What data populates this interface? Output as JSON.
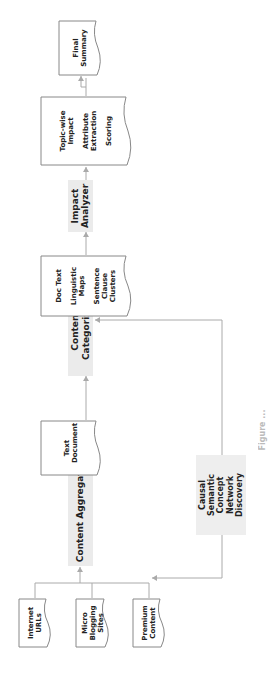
{
  "diagram": {
    "orientation": "rotated -90deg (reads bottom-to-top)",
    "inputs": [
      {
        "id": "internet-urls",
        "label": "Internet URLs"
      },
      {
        "id": "micro-blogging",
        "label": "Micro Blogging Sites"
      },
      {
        "id": "premium-content",
        "label": "Premium Content"
      }
    ],
    "processes": {
      "aggregator": "Content Aggregator",
      "categorizer": "Content Categorizer",
      "analyzer": "Impact Analyzer",
      "causal": "Causal Semantic Concept Network Discovery"
    },
    "documents": {
      "text_document": "Text Document",
      "doc_text": {
        "line1": "Doc Text",
        "line2": "Linguistic Maps",
        "line3": "Sentence Clause Clusters"
      },
      "topic_wise": {
        "line1": "Topic-wise Impact",
        "line2": "Attribute Extraction",
        "line3": "Scoring"
      },
      "final_summary": "Final Summary"
    },
    "caption": "Figure ..."
  },
  "colors": {
    "process_fill": "#ebebeb",
    "doc_stroke": "#888888",
    "connector": "#aaaaaa",
    "text": "#222222"
  }
}
